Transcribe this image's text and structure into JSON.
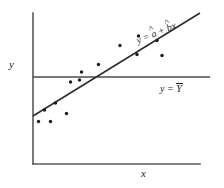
{
  "figure": {
    "name": "regression-scatterplot",
    "axes": {
      "y_label": "y",
      "x_label": "x"
    },
    "annotations": {
      "fit_line": {
        "prefix": "y",
        "operator_equals": " = ",
        "intercept": "a",
        "operator_plus": " + ",
        "slope": "b",
        "variable": "x",
        "full_text": "y = â + b̂x"
      },
      "mean_line": {
        "prefix": "y",
        "operator_equals": " = ",
        "mean_symbol": "Y",
        "full_text": "y = Ȳ"
      }
    },
    "colors": {
      "axis": "#58585a",
      "fit_line": "#2b2b2d",
      "mean_line": "#4c4c4e",
      "point": "#1b1b1d",
      "background": "#ffffff"
    }
  },
  "chart_data": {
    "type": "scatter",
    "title": "",
    "xlabel": "x",
    "ylabel": "y",
    "grid": false,
    "legend": "none",
    "xlim": [
      33,
      200
    ],
    "ylim": [
      164,
      13
    ],
    "points": [
      {
        "x": 38.5,
        "y": 121.5
      },
      {
        "x": 50.5,
        "y": 121.5
      },
      {
        "x": 44.5,
        "y": 110.0
      },
      {
        "x": 55.5,
        "y": 103.0
      },
      {
        "x": 66.5,
        "y": 113.5
      },
      {
        "x": 70.5,
        "y": 82.0
      },
      {
        "x": 79.5,
        "y": 80.0
      },
      {
        "x": 81.5,
        "y": 72.0
      },
      {
        "x": 98.5,
        "y": 64.5
      },
      {
        "x": 120.0,
        "y": 45.5
      },
      {
        "x": 138.5,
        "y": 36.0
      },
      {
        "x": 137.0,
        "y": 54.5
      },
      {
        "x": 157.0,
        "y": 40.5
      },
      {
        "x": 162.0,
        "y": 55.5
      }
    ],
    "lines": [
      {
        "name": "fitted-regression-line",
        "label": "y = â + b̂x",
        "x1": 33,
        "y1": 116,
        "x2": 200,
        "y2": 13
      },
      {
        "name": "mean-line",
        "label": "y = Ȳ",
        "x1": 33,
        "y1": 77,
        "x2": 210,
        "y2": 77
      }
    ],
    "axis_lines": [
      {
        "name": "y-axis",
        "x1": 33,
        "y1": 13,
        "x2": 33,
        "y2": 164
      },
      {
        "name": "x-axis",
        "x1": 33,
        "y1": 164,
        "x2": 200,
        "y2": 164
      }
    ]
  }
}
